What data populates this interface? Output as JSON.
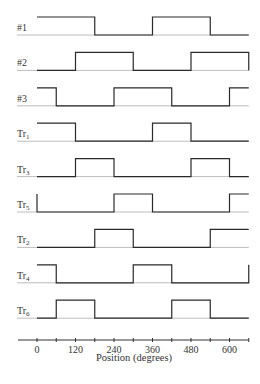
{
  "chart_data": {
    "type": "timing-diagram",
    "title": "",
    "xlabel": "Position (degrees)",
    "ylabel": "",
    "xlim": [
      0,
      660
    ],
    "ticks": [
      0,
      120,
      240,
      360,
      480,
      600
    ],
    "minor_tick_step": 60,
    "grid": false,
    "signals": [
      {
        "name": "#1",
        "label": "#1",
        "sub": "",
        "initial": 1,
        "transitions": [
          180,
          360,
          540
        ]
      },
      {
        "name": "#2",
        "label": "#2",
        "sub": "",
        "initial": 0,
        "transitions": [
          120,
          300,
          480,
          660
        ]
      },
      {
        "name": "#3",
        "label": "#3",
        "sub": "",
        "initial": 1,
        "transitions": [
          60,
          240,
          420,
          600
        ]
      },
      {
        "name": "Tr1",
        "label": "Tr",
        "sub": "1",
        "initial": 1,
        "transitions": [
          120,
          360,
          480
        ]
      },
      {
        "name": "Tr3",
        "label": "Tr",
        "sub": "3",
        "initial": 0,
        "transitions": [
          120,
          240,
          480,
          600
        ]
      },
      {
        "name": "Tr5",
        "label": "Tr",
        "sub": "5",
        "initial": 1,
        "transitions": [
          0,
          240,
          360,
          600
        ]
      },
      {
        "name": "Tr2",
        "label": "Tr",
        "sub": "2",
        "initial": 0,
        "transitions": [
          180,
          300,
          540
        ]
      },
      {
        "name": "Tr4",
        "label": "Tr",
        "sub": "4",
        "initial": 1,
        "transitions": [
          60,
          300,
          420,
          660
        ]
      },
      {
        "name": "Tr6",
        "label": "Tr",
        "sub": "6",
        "initial": 0,
        "transitions": [
          60,
          180,
          420,
          540
        ]
      }
    ]
  },
  "axis": {
    "title": "Position (degrees)",
    "tick_labels": [
      "0",
      "120",
      "240",
      "360",
      "480",
      "600"
    ]
  },
  "colors": {
    "waveform": "#2a2a2a",
    "reference": "#bdbdbd",
    "axis": "#333333"
  }
}
